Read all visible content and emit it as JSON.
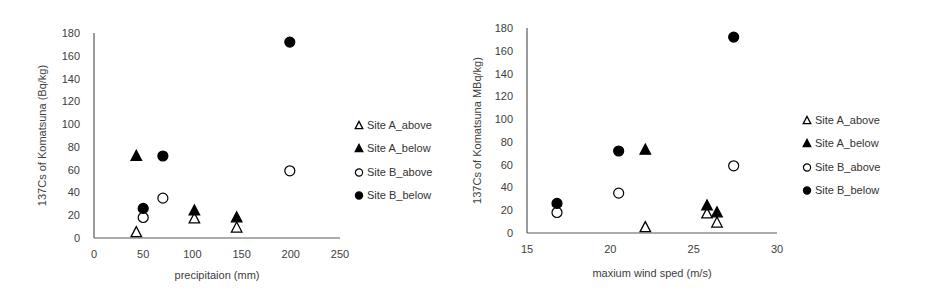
{
  "chart_data": [
    {
      "type": "scatter",
      "title": "",
      "xlabel": "precipitaion (mm)",
      "ylabel": "137Cs of Komatsuna (Bq/kg)",
      "xlim": [
        0,
        250
      ],
      "ylim": [
        0,
        180
      ],
      "xticks": [
        0,
        50,
        100,
        150,
        200,
        250
      ],
      "yticks": [
        0,
        20,
        40,
        60,
        80,
        100,
        120,
        140,
        160,
        180
      ],
      "grid": false,
      "legend_position": "right",
      "series": [
        {
          "name": "Site A_above",
          "marker": "open-triangle",
          "points": [
            [
              43,
              5
            ],
            [
              102,
              17
            ],
            [
              145,
              9
            ]
          ]
        },
        {
          "name": "Site A_below",
          "marker": "filled-triangle",
          "points": [
            [
              43,
              72
            ],
            [
              102,
              24
            ],
            [
              145,
              18
            ]
          ]
        },
        {
          "name": "Site B_above",
          "marker": "open-circle",
          "points": [
            [
              50,
              18
            ],
            [
              70,
              35
            ],
            [
              199,
              59
            ]
          ]
        },
        {
          "name": "Site B_below",
          "marker": "filled-circle",
          "points": [
            [
              50,
              26
            ],
            [
              70,
              72
            ],
            [
              199,
              172
            ]
          ]
        }
      ]
    },
    {
      "type": "scatter",
      "title": "",
      "xlabel": "maxium wind sped (m/s)",
      "ylabel": "137Cs  of Komatsuna MBq/kg)",
      "xlim": [
        15,
        30
      ],
      "ylim": [
        0,
        180
      ],
      "xticks": [
        15,
        20,
        25,
        30
      ],
      "yticks": [
        0,
        20,
        40,
        60,
        80,
        100,
        120,
        140,
        160,
        180
      ],
      "grid": false,
      "legend_position": "right",
      "series": [
        {
          "name": "Site A_above",
          "marker": "open-triangle",
          "points": [
            [
              22.1,
              5
            ],
            [
              25.8,
              17
            ],
            [
              26.4,
              9
            ]
          ]
        },
        {
          "name": "Site A_below",
          "marker": "filled-triangle",
          "points": [
            [
              22.1,
              73
            ],
            [
              25.8,
              24
            ],
            [
              26.4,
              18
            ]
          ]
        },
        {
          "name": "Site B_above",
          "marker": "open-circle",
          "points": [
            [
              16.8,
              18
            ],
            [
              20.5,
              35
            ],
            [
              27.4,
              59
            ]
          ]
        },
        {
          "name": "Site B_below",
          "marker": "filled-circle",
          "points": [
            [
              16.8,
              26
            ],
            [
              20.5,
              72
            ],
            [
              27.4,
              172
            ]
          ]
        }
      ]
    }
  ]
}
